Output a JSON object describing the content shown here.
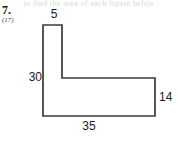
{
  "page": {
    "width": 178,
    "height": 141,
    "background_color": "#ffffff",
    "bleed_text": "to find the area of each figure below"
  },
  "problem": {
    "number": "7.",
    "reference": "(17)"
  },
  "figure": {
    "name": "l-shaped-polygon",
    "stroke_color": "#3a3a3a",
    "fill_color": "#ffffff",
    "stroke_width": 1.7,
    "vertices": [
      [
        43,
        25
      ],
      [
        62,
        25
      ],
      [
        62,
        78
      ],
      [
        155,
        78
      ],
      [
        155,
        116
      ],
      [
        43,
        116
      ]
    ],
    "labels": {
      "top": "5",
      "left": "30",
      "right": "14",
      "bottom": "35"
    }
  }
}
